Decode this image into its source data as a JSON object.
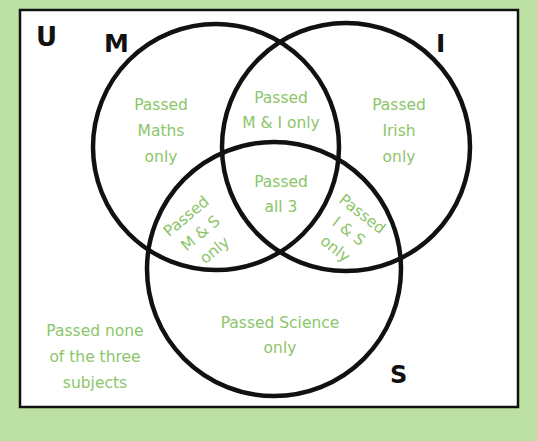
{
  "diagram": {
    "type": "venn",
    "colors": {
      "background": "#bce0a4",
      "panel": "#ffffff",
      "outline": "#111111",
      "region_text": "#8cc56a"
    },
    "universe_label": "U",
    "sets": [
      {
        "id": "M",
        "label": "M",
        "meaning": "Maths"
      },
      {
        "id": "I",
        "label": "I",
        "meaning": "Irish"
      },
      {
        "id": "S",
        "label": "S",
        "meaning": "Science"
      }
    ],
    "regions": {
      "maths_only": [
        "Passed",
        "Maths",
        "only"
      ],
      "m_and_i_only": [
        "Passed",
        "M & I only"
      ],
      "irish_only": [
        "Passed",
        "Irish",
        "only"
      ],
      "all_three": [
        "Passed",
        "all 3"
      ],
      "m_and_s_only": [
        "Passed",
        "M & S",
        "only"
      ],
      "i_and_s_only": [
        "Passed",
        "I & S",
        "only"
      ],
      "science_only": [
        "Passed Science",
        "only"
      ],
      "none": [
        "Passed none",
        "of the three",
        "subjects"
      ]
    }
  }
}
